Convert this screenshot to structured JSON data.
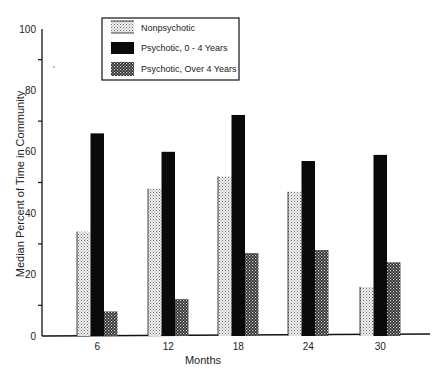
{
  "chart_data": {
    "type": "bar",
    "title": "",
    "xlabel": "Months",
    "ylabel": "Median Percent of Time in Community",
    "categories": [
      "6",
      "12",
      "18",
      "24",
      "30"
    ],
    "series": [
      {
        "name": "Nonpsychotic",
        "pattern": "light-dots",
        "values": [
          34,
          48,
          52,
          47,
          16
        ]
      },
      {
        "name": "Psychotic, 0 - 4 Years",
        "pattern": "solid-black",
        "values": [
          66,
          60,
          72,
          57,
          59
        ]
      },
      {
        "name": "Psychotic, Over 4 Years",
        "pattern": "dark-checker",
        "values": [
          8,
          12,
          27,
          28,
          24
        ]
      }
    ],
    "ylim": [
      0,
      100
    ],
    "yticks_labeled": [
      0,
      20,
      40,
      60,
      80,
      100
    ],
    "yticks_minor": [
      10,
      30,
      50,
      70,
      90
    ],
    "grid": false,
    "legend_position": "top-left-inside"
  },
  "colors": {
    "axis": "#111111",
    "solid": "#0a0a0a",
    "light_pattern_bg": "#f2f2f2",
    "light_pattern_dot": "#6a6a6a",
    "dark_pattern_bg": "#2a2a2a",
    "dark_pattern_dot": "#d8d8d8"
  }
}
